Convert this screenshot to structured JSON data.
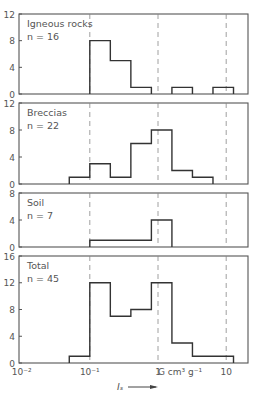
{
  "chart_data": {
    "type": "bar",
    "subtype": "histogram",
    "x_scale": "log",
    "bin_edges": [
      0.05,
      0.1,
      0.2,
      0.4,
      0.8,
      1.6,
      3.2,
      6.4,
      12.8
    ],
    "xlim": [
      0.01,
      20
    ],
    "x_ticks": [
      {
        "value": 0.01,
        "label": "10⁻²"
      },
      {
        "value": 0.1,
        "label": "10⁻¹"
      },
      {
        "value": 1,
        "label": "1"
      },
      {
        "value": 10,
        "label": "10"
      }
    ],
    "x_unit_label": "G cm³ g⁻¹",
    "xlabel": "Iₛ",
    "xlabel_arrow": "⟶",
    "dashed_gridlines_x": [
      0.1,
      1,
      10
    ],
    "panels": [
      {
        "name": "Igneous rocks",
        "n_label": "n = 16",
        "ylim": [
          0,
          12
        ],
        "y_ticks": [
          0,
          4,
          8,
          12
        ],
        "counts": [
          0,
          8,
          5,
          1,
          0,
          1,
          0,
          1
        ]
      },
      {
        "name": "Breccias",
        "n_label": "n = 22",
        "ylim": [
          0,
          12
        ],
        "y_ticks": [
          0,
          4,
          8,
          12
        ],
        "counts": [
          1,
          3,
          1,
          6,
          8,
          2,
          1,
          0
        ]
      },
      {
        "name": "Soil",
        "n_label": "n = 7",
        "ylim": [
          0,
          8
        ],
        "y_ticks": [
          0,
          4,
          8
        ],
        "counts": [
          0,
          1,
          1,
          1,
          4,
          0,
          0,
          0
        ]
      },
      {
        "name": "Total",
        "n_label": "n = 45",
        "ylim": [
          0,
          16
        ],
        "y_ticks": [
          0,
          4,
          8,
          12,
          16
        ],
        "counts": [
          1,
          12,
          7,
          8,
          12,
          3,
          1,
          1
        ]
      }
    ],
    "grid": false,
    "legend": "none"
  }
}
